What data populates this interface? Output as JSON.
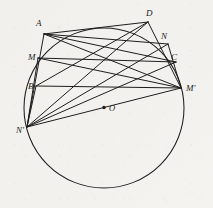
{
  "figure": {
    "background_color": "#f4f3f0",
    "ink_color": "#1d1d1d",
    "width": 213,
    "height": 208
  },
  "circle": {
    "name": "main-circle",
    "center": {
      "x": 104,
      "y": 108
    },
    "radius": 80,
    "center_label": "O"
  },
  "points": [
    {
      "id": "A",
      "label": "A",
      "x": 44,
      "y": 34,
      "label_x": 36,
      "label_y": 26
    },
    {
      "id": "D",
      "label": "D",
      "x": 148,
      "y": 22,
      "label_x": 146,
      "label_y": 16
    },
    {
      "id": "N",
      "label": "N",
      "x": 168,
      "y": 44,
      "label_x": 161,
      "label_y": 39
    },
    {
      "id": "C",
      "label": "C",
      "x": 176,
      "y": 62,
      "label_x": 171,
      "label_y": 60
    },
    {
      "id": "M",
      "label": "M",
      "x": 38,
      "y": 58,
      "label_x": 28,
      "label_y": 60
    },
    {
      "id": "B",
      "label": "B",
      "x": 36,
      "y": 86,
      "label_x": 28,
      "label_y": 89
    },
    {
      "id": "Mp",
      "label": "M'",
      "x": 181,
      "y": 88,
      "label_x": 186,
      "label_y": 91
    },
    {
      "id": "Np",
      "label": "N'",
      "x": 27,
      "y": 127,
      "label_x": 16,
      "label_y": 133
    }
  ],
  "chords": [
    {
      "name": "chord-A-D",
      "from": "A",
      "to": "D"
    },
    {
      "name": "chord-A-N",
      "from": "A",
      "to": "N"
    },
    {
      "name": "chord-A-C",
      "from": "A",
      "to": "C"
    },
    {
      "name": "chord-A-Mp",
      "from": "A",
      "to": "Mp"
    },
    {
      "name": "chord-A-Np",
      "from": "A",
      "to": "Np"
    },
    {
      "name": "chord-M-C",
      "from": "M",
      "to": "C"
    },
    {
      "name": "chord-M-Mp",
      "from": "M",
      "to": "Mp"
    },
    {
      "name": "chord-M-Np",
      "from": "M",
      "to": "Np"
    },
    {
      "name": "chord-B-Mp",
      "from": "B",
      "to": "Mp"
    },
    {
      "name": "chord-B-D",
      "from": "B",
      "to": "D"
    },
    {
      "name": "chord-B-Np",
      "from": "B",
      "to": "Np"
    },
    {
      "name": "chord-D-Np",
      "from": "D",
      "to": "Np"
    },
    {
      "name": "chord-D-Mp",
      "from": "D",
      "to": "Mp"
    },
    {
      "name": "chord-N-Np",
      "from": "N",
      "to": "Np"
    },
    {
      "name": "chord-C-Np",
      "from": "C",
      "to": "Np"
    },
    {
      "name": "chord-Mp-Np",
      "from": "Mp",
      "to": "Np"
    },
    {
      "name": "chord-N-Mp",
      "from": "N",
      "to": "Mp"
    }
  ]
}
